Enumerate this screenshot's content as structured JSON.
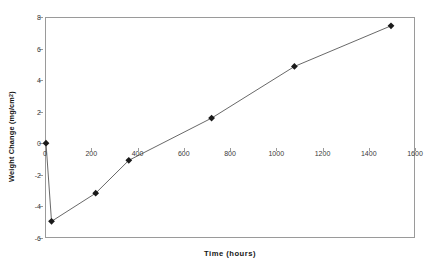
{
  "chart_data": {
    "type": "line",
    "title": "",
    "xlabel": "Time (hours)",
    "ylabel_text": "Weight Change (mg/cm",
    "ylabel_sup": "2",
    "ylabel_tail": ")",
    "ylabel_full": "Weight Change (mg/cm2)",
    "xlim": [
      0,
      1600
    ],
    "ylim": [
      -6,
      8
    ],
    "xticks": [
      0,
      200,
      400,
      600,
      800,
      1000,
      1200,
      1400,
      1600
    ],
    "xtick_labels": [
      "0",
      "200",
      "400",
      "600",
      "800",
      "1000",
      "1200",
      "1400",
      "1600"
    ],
    "yticks": [
      -6,
      -4,
      -2,
      0,
      2,
      4,
      6,
      8
    ],
    "ytick_labels": [
      "-6",
      "-4",
      "-2",
      "0",
      "2",
      "4",
      "6",
      "8"
    ],
    "grid": false,
    "legend": null,
    "marker": "diamond",
    "series": [
      {
        "name": "Weight Change",
        "color": "#1a1a1a",
        "line_color": "#555555",
        "x": [
          0,
          24,
          216,
          360,
          720,
          1080,
          1500
        ],
        "y": [
          0.0,
          -5.0,
          -3.2,
          -1.1,
          1.6,
          4.9,
          7.5
        ]
      }
    ]
  },
  "colors": {
    "axis": "#9a9a9a",
    "tick_text": "#3a3a3a",
    "title_text": "#151515",
    "marker": "#1a1a1a",
    "line": "#555555",
    "background": "#ffffff"
  }
}
